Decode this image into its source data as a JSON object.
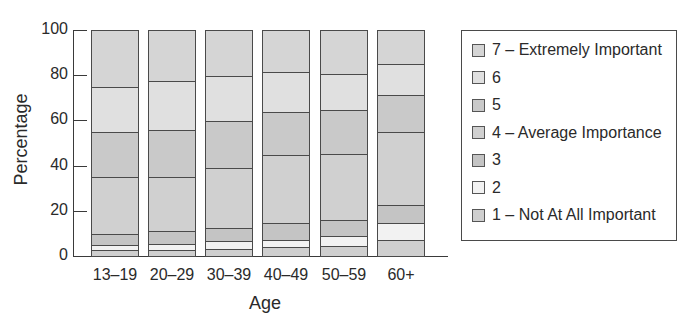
{
  "chart_data": {
    "type": "bar",
    "stacked": true,
    "title": "",
    "xlabel": "Age",
    "ylabel": "Percentage",
    "ylim": [
      0,
      100
    ],
    "yticks": [
      "0",
      "20",
      "40",
      "60",
      "80",
      "100"
    ],
    "categories": [
      "13–19",
      "20–29",
      "30–39",
      "40–49",
      "50–59",
      "60+"
    ],
    "series": [
      {
        "name": "1 – Not At All Important",
        "color": "#cfcfcf",
        "values": [
          2.5,
          2.5,
          3,
          4,
          4.5,
          7
        ]
      },
      {
        "name": "2",
        "color": "#f2f2f2",
        "values": [
          2.5,
          3,
          3.5,
          3,
          4.5,
          7.5
        ]
      },
      {
        "name": "3",
        "color": "#c4c4c4",
        "values": [
          5,
          5.5,
          6,
          7.5,
          7,
          8
        ]
      },
      {
        "name": "4 – Average Importance",
        "color": "#d0d0d0",
        "values": [
          25,
          24,
          26.5,
          30.5,
          29.5,
          32.5
        ]
      },
      {
        "name": "5",
        "color": "#c9c9c9",
        "values": [
          20,
          21,
          21,
          19,
          19.5,
          16.5
        ]
      },
      {
        "name": "6",
        "color": "#e0e0e0",
        "values": [
          20,
          22,
          20,
          18,
          16,
          14
        ]
      },
      {
        "name": "7 – Extremely Important",
        "color": "#d5d5d5",
        "values": [
          25,
          22,
          20,
          18,
          19,
          14.5
        ]
      }
    ],
    "legend_order": [
      "7 – Extremely Important",
      "6",
      "5",
      "4 – Average Importance",
      "3",
      "2",
      "1 – Not At All Important"
    ],
    "legend_position": "right",
    "grid": false
  },
  "axis": {
    "y_title": "Percentage",
    "x_title": "Age"
  }
}
